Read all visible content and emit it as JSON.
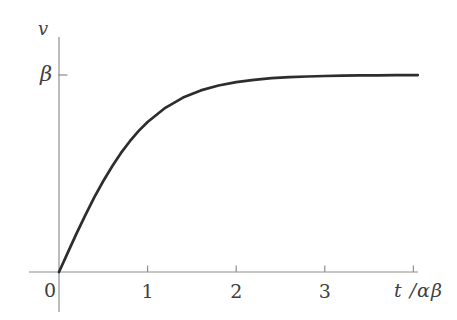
{
  "figure": {
    "background": "#ffffff",
    "axis_color": "#8f8f8f",
    "tick_color": "#8f8f8f",
    "curve_color": "#2d2d2d",
    "label_color": "#3f3f3f"
  },
  "chart_data": {
    "type": "line",
    "title": "",
    "xlabel": "t /αβ",
    "ylabel": "v",
    "origin_label": "0",
    "x_range": [
      0,
      4.05
    ],
    "y_range": [
      0,
      1.1
    ],
    "grid": false,
    "legend": false,
    "x_ticks": [
      {
        "value": 1,
        "label": "1"
      },
      {
        "value": 2,
        "label": "2"
      },
      {
        "value": 3,
        "label": "3"
      },
      {
        "value": 4,
        "label": ""
      }
    ],
    "y_ticks": [
      {
        "value": 1.0,
        "label": "β"
      }
    ],
    "series": [
      {
        "name": "v(t) = β tanh(t/αβ)",
        "x": [
          0,
          0.1,
          0.2,
          0.3,
          0.4,
          0.5,
          0.6,
          0.7,
          0.8,
          0.9,
          1.0,
          1.2,
          1.4,
          1.6,
          1.8,
          2.0,
          2.2,
          2.4,
          2.6,
          2.8,
          3.0,
          3.2,
          3.4,
          3.6,
          3.8,
          4.0,
          4.05
        ],
        "y": [
          0,
          0.0997,
          0.1974,
          0.2913,
          0.3799,
          0.4621,
          0.537,
          0.6044,
          0.664,
          0.7163,
          0.7616,
          0.8337,
          0.8854,
          0.9217,
          0.9468,
          0.964,
          0.9757,
          0.9837,
          0.989,
          0.9926,
          0.9951,
          0.9967,
          0.9978,
          0.9985,
          0.999,
          0.9993,
          0.9994
        ]
      }
    ],
    "asymptote_note": "curve saturates at v = β"
  }
}
